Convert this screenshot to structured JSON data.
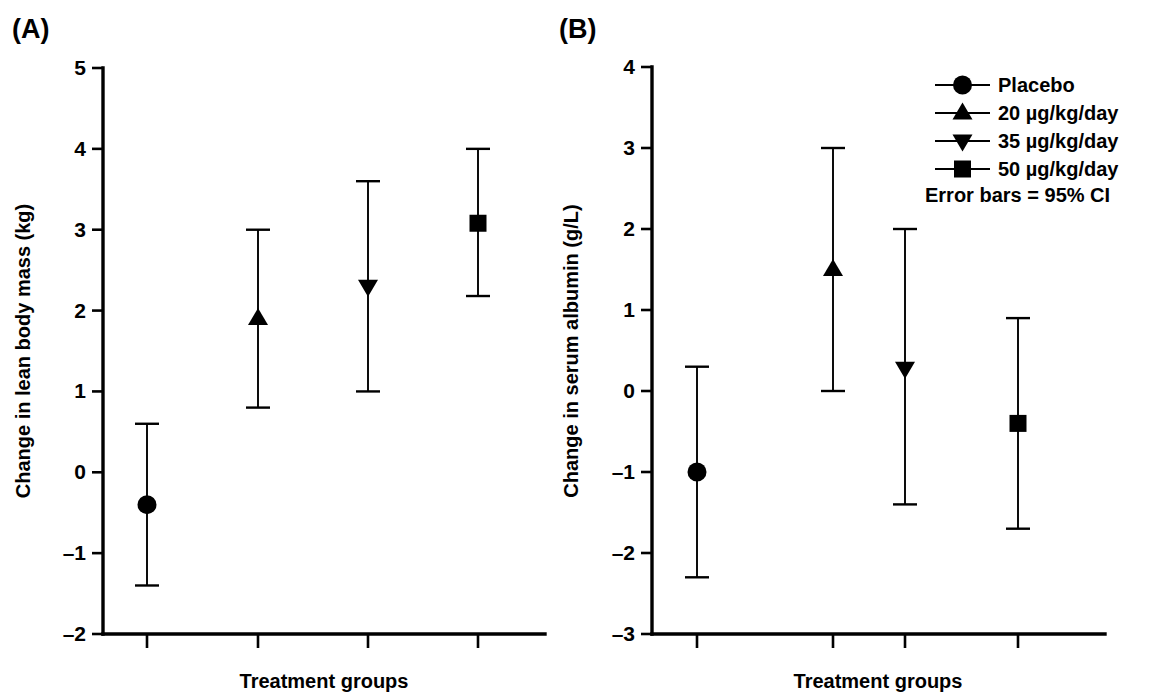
{
  "figure": {
    "panel_a_label": "(A)",
    "panel_b_label": "(B)"
  },
  "legend": {
    "position": "top-right",
    "entries": [
      {
        "label": "Placebo",
        "marker": "circle"
      },
      {
        "label": "20 µg/kg/day",
        "marker": "triangle-up"
      },
      {
        "label": "35 µg/kg/day",
        "marker": "triangle-down"
      },
      {
        "label": "50 µg/kg/day",
        "marker": "square"
      }
    ],
    "note": "Error bars = 95% CI"
  },
  "chart_data": [
    {
      "type": "scatter",
      "panel": "(A)",
      "title": "",
      "xlabel": "Treatment groups",
      "ylabel": "Change in lean body mass (kg)",
      "ylim": [
        -2,
        5
      ],
      "yticks": [
        -2,
        -1,
        0,
        1,
        2,
        3,
        4,
        5
      ],
      "ytick_labels": [
        "–2",
        "–1",
        "0",
        "1",
        "2",
        "3",
        "4",
        "5"
      ],
      "xtick_labels": [
        "",
        "",
        "",
        ""
      ],
      "grid": false,
      "error_bar_type": "95% CI",
      "categories": [
        "Placebo",
        "20 µg/kg/day",
        "35 µg/kg/day",
        "50 µg/kg/day"
      ],
      "markers": [
        "circle",
        "triangle-up",
        "triangle-down",
        "square"
      ],
      "values": [
        -0.4,
        1.9,
        2.3,
        3.08
      ],
      "ci_lower": [
        -1.4,
        0.8,
        1.0,
        2.18
      ],
      "ci_upper": [
        0.6,
        3.0,
        3.6,
        4.0
      ]
    },
    {
      "type": "scatter",
      "panel": "(B)",
      "title": "",
      "xlabel": "Treatment groups",
      "ylabel": "Change in serum albumin (g/L)",
      "ylim": [
        -3,
        4
      ],
      "yticks": [
        -3,
        -2,
        -1,
        0,
        1,
        2,
        3,
        4
      ],
      "ytick_labels": [
        "–3",
        "–2",
        "–1",
        "0",
        "1",
        "2",
        "3",
        "4"
      ],
      "xtick_labels": [
        "",
        "",
        "",
        ""
      ],
      "grid": false,
      "error_bar_type": "95% CI",
      "categories": [
        "Placebo",
        "20 µg/kg/day",
        "35 µg/kg/day",
        "50 µg/kg/day"
      ],
      "markers": [
        "circle",
        "triangle-up",
        "triangle-down",
        "square"
      ],
      "values": [
        -1.0,
        1.5,
        0.28,
        -0.4
      ],
      "ci_lower": [
        -2.3,
        0.0,
        -1.4,
        -1.7
      ],
      "ci_upper": [
        0.3,
        3.0,
        2.0,
        0.9
      ]
    }
  ],
  "colors": {
    "foreground": "#000000",
    "background": "#ffffff"
  }
}
